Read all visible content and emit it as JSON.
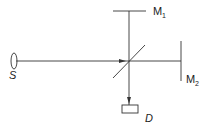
{
  "diagram": {
    "colors": {
      "stroke": "#333333",
      "background": "#ffffff"
    },
    "labels": {
      "source": "S",
      "mirror1_main": "M",
      "mirror1_sub": "1",
      "mirror2_main": "M",
      "mirror2_sub": "2",
      "detector": "D"
    },
    "components": [
      {
        "id": "source",
        "label": "S",
        "shape": "ellipse"
      },
      {
        "id": "beam-splitter",
        "label": "",
        "shape": "diagonal-line"
      },
      {
        "id": "mirror-1",
        "label": "M1",
        "shape": "line"
      },
      {
        "id": "mirror-2",
        "label": "M2",
        "shape": "line"
      },
      {
        "id": "detector",
        "label": "D",
        "shape": "rectangle"
      }
    ]
  }
}
